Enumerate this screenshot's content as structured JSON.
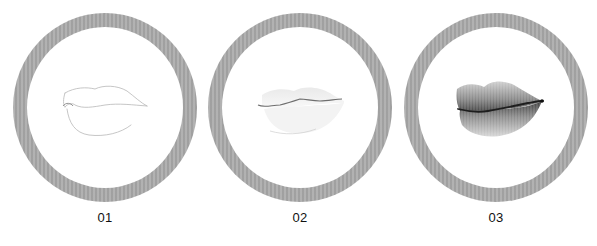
{
  "steps": [
    {
      "label": "01",
      "stage": "outline",
      "description": "light pencil outline of lips"
    },
    {
      "label": "02",
      "stage": "light-shading",
      "description": "mouth line defined, faint shading"
    },
    {
      "label": "03",
      "stage": "full-shading",
      "description": "fully shaded realistic lips"
    }
  ],
  "colors": {
    "ring": "#a9a9a9",
    "background": "#ffffff",
    "label": "#111111"
  }
}
